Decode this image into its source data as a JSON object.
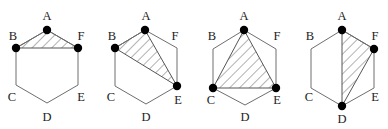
{
  "figure": {
    "colors": {
      "outline": "#6e6e6e",
      "hatch": "#555555",
      "dot": "#000000",
      "label": "#222222"
    },
    "hexagons": [
      {
        "id": "hex-1",
        "vertices": {
          "A": [
            47,
            30
          ],
          "B": [
            16,
            48
          ],
          "C": [
            16,
            85
          ],
          "D": [
            47,
            103
          ],
          "E": [
            78,
            85
          ],
          "F": [
            78,
            48
          ]
        },
        "labels": {
          "A": {
            "text": "A",
            "pos": [
              47,
              17
            ]
          },
          "B": {
            "text": "B",
            "pos": [
              13,
              37
            ]
          },
          "C": {
            "text": "C",
            "pos": [
              12,
              98
            ]
          },
          "D": {
            "text": "D",
            "pos": [
              47,
              118
            ]
          },
          "E": {
            "text": "E",
            "pos": [
              81,
              98
            ]
          },
          "F": {
            "text": "F",
            "pos": [
              81,
              37
            ]
          }
        },
        "shaded_triangle": [
          "A",
          "B",
          "F"
        ],
        "marked_vertices": [
          "A",
          "B",
          "F"
        ]
      },
      {
        "id": "hex-2",
        "vertices": {
          "A": [
            145,
            30
          ],
          "B": [
            115,
            48
          ],
          "C": [
            115,
            86
          ],
          "D": [
            146,
            104
          ],
          "E": [
            177,
            86
          ],
          "F": [
            177,
            48
          ]
        },
        "labels": {
          "A": {
            "text": "A",
            "pos": [
              146,
              17
            ]
          },
          "B": {
            "text": "B",
            "pos": [
              112,
              37
            ]
          },
          "C": {
            "text": "C",
            "pos": [
              111,
              98
            ]
          },
          "D": {
            "text": "D",
            "pos": [
              146,
              118
            ]
          },
          "E": {
            "text": "E",
            "pos": [
              178,
              101
            ]
          },
          "F": {
            "text": "F",
            "pos": [
              175,
              37
            ]
          }
        },
        "shaded_triangle": [
          "A",
          "B",
          "E"
        ],
        "marked_vertices": [
          "A",
          "B",
          "E"
        ]
      },
      {
        "id": "hex-3",
        "vertices": {
          "A": [
            244,
            30
          ],
          "B": [
            213,
            49
          ],
          "C": [
            213,
            88
          ],
          "D": [
            245,
            105
          ],
          "E": [
            276,
            88
          ],
          "F": [
            276,
            49
          ]
        },
        "labels": {
          "A": {
            "text": "A",
            "pos": [
              244,
              17
            ]
          },
          "B": {
            "text": "B",
            "pos": [
              212,
              37
            ]
          },
          "C": {
            "text": "C",
            "pos": [
              211,
              101
            ]
          },
          "D": {
            "text": "D",
            "pos": [
              245,
              118
            ]
          },
          "E": {
            "text": "E",
            "pos": [
              277,
              101
            ]
          },
          "F": {
            "text": "F",
            "pos": [
              277,
              37
            ]
          }
        },
        "shaded_triangle": [
          "A",
          "C",
          "E"
        ],
        "marked_vertices": [
          "A",
          "C",
          "E"
        ]
      },
      {
        "id": "hex-4",
        "vertices": {
          "A": [
            342,
            30
          ],
          "B": [
            311,
            49
          ],
          "C": [
            311,
            88
          ],
          "D": [
            342,
            106
          ],
          "E": [
            374,
            88
          ],
          "F": [
            374,
            49
          ]
        },
        "labels": {
          "A": {
            "text": "A",
            "pos": [
              342,
              17
            ]
          },
          "B": {
            "text": "B",
            "pos": [
              310,
              37
            ]
          },
          "C": {
            "text": "C",
            "pos": [
              309,
              98
            ]
          },
          "D": {
            "text": "D",
            "pos": [
              342,
              120
            ]
          },
          "E": {
            "text": "E",
            "pos": [
              375,
              98
            ]
          },
          "F": {
            "text": "F",
            "pos": [
              375,
              37
            ]
          }
        },
        "shaded_triangle": [
          "A",
          "F",
          "D"
        ],
        "marked_vertices": [
          "A",
          "F",
          "D"
        ]
      }
    ]
  }
}
